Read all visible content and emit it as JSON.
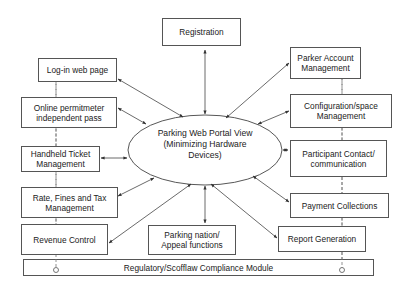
{
  "diagram": {
    "center": {
      "label_line1": "Parking Web Portal View",
      "label_line2": "(Minimizing Hardware",
      "label_line3": "Devices)"
    },
    "modules": {
      "registration": "Registration",
      "login": "Log-in web page",
      "online_permit_1": "Online permitmeter",
      "online_permit_2": "independent pass",
      "handheld_1": "Handheld Ticket",
      "handheld_2": "Management",
      "rate_1": "Rate, Fines and Tax",
      "rate_2": "Management",
      "revenue": "Revenue Control",
      "appeal_1": "Parking nation/",
      "appeal_2": "Appeal functions",
      "parker_1": "Parker Account",
      "parker_2": "Management",
      "config_1": "Configuration/space",
      "config_2": "Management",
      "participant_1": "Participant Contact/",
      "participant_2": "communication",
      "payment": "Payment Collections",
      "report": "Report Generation"
    },
    "compliance_bar": "Regulatory/Scofflaw Compliance Module",
    "colors": {
      "line": "#444444",
      "box_border": "#555555",
      "dashed": "#777777"
    }
  }
}
